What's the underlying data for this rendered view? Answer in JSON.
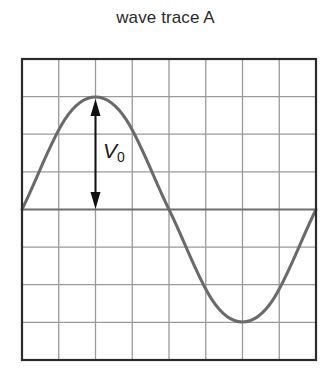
{
  "diagram": {
    "title": "wave trace A",
    "label": {
      "symbol": "V",
      "subscript": "0"
    },
    "grid": {
      "columns": 8,
      "rows": 8,
      "frame_color": "#2b2b2b",
      "grid_color": "#9a9a9a",
      "axis_color": "#6e6e6e"
    },
    "trace": {
      "shape": "sine",
      "periods": 1,
      "amplitude_divisions": 3,
      "color": "#6a6a6a"
    },
    "arrow": {
      "from": "center-line",
      "to": "peak",
      "double_headed": true,
      "color": "#111111"
    }
  }
}
